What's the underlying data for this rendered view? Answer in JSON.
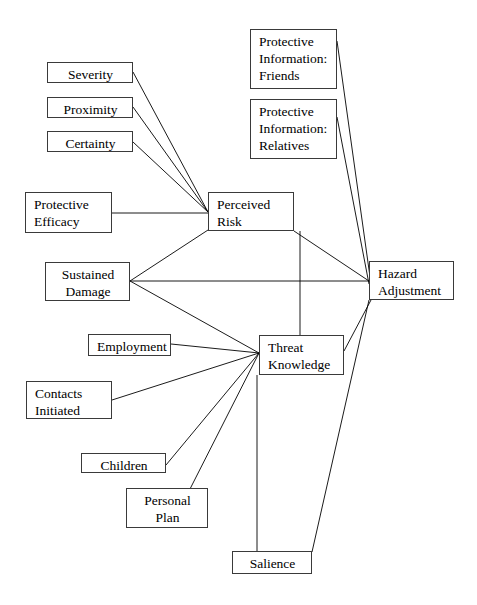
{
  "diagram": {
    "type": "path-diagram",
    "background_color": "#ffffff",
    "box_border_color": "#3a3a3a",
    "edge_color": "#000000",
    "nodes": [
      {
        "id": "severity",
        "label": "Severity",
        "x": 47,
        "y": 62,
        "w": 86,
        "h": 21,
        "align": "center"
      },
      {
        "id": "proximity",
        "label": "Proximity",
        "x": 47,
        "y": 97,
        "w": 86,
        "h": 21,
        "align": "center"
      },
      {
        "id": "certainty",
        "label": "Certainty",
        "x": 47,
        "y": 131,
        "w": 86,
        "h": 21,
        "align": "center"
      },
      {
        "id": "protective-efficacy",
        "label": "Protective\nEfficacy",
        "x": 25,
        "y": 192,
        "w": 87,
        "h": 41,
        "align": "left"
      },
      {
        "id": "sustained-damage",
        "label": "Sustained\nDamage",
        "x": 45,
        "y": 262,
        "w": 85,
        "h": 39,
        "align": "center"
      },
      {
        "id": "employment",
        "label": "Employment",
        "x": 88,
        "y": 334,
        "w": 83,
        "h": 22,
        "align": "center"
      },
      {
        "id": "contacts-initiated",
        "label": "Contacts\nInitiated",
        "x": 26,
        "y": 381,
        "w": 86,
        "h": 38,
        "align": "left"
      },
      {
        "id": "children",
        "label": "Children",
        "x": 81,
        "y": 453,
        "w": 85,
        "h": 20,
        "align": "center"
      },
      {
        "id": "personal-plan",
        "label": "Personal\nPlan",
        "x": 126,
        "y": 488,
        "w": 82,
        "h": 40,
        "align": "center"
      },
      {
        "id": "salience",
        "label": "Salience",
        "x": 232,
        "y": 551,
        "w": 80,
        "h": 23,
        "align": "center"
      },
      {
        "id": "perceived-risk",
        "label": "Perceived\nRisk",
        "x": 208,
        "y": 192,
        "w": 86,
        "h": 39,
        "align": "left"
      },
      {
        "id": "threat-knowledge",
        "label": "Threat\nKnowledge",
        "x": 259,
        "y": 335,
        "w": 85,
        "h": 40,
        "align": "left"
      },
      {
        "id": "protective-info-friends",
        "label": "Protective\nInformation:\nFriends",
        "x": 250,
        "y": 29,
        "w": 87,
        "h": 60,
        "align": "left"
      },
      {
        "id": "protective-info-relatives",
        "label": "Protective\nInformation:\nRelatives",
        "x": 250,
        "y": 99,
        "w": 87,
        "h": 60,
        "align": "left"
      },
      {
        "id": "hazard-adjustment",
        "label": "Hazard\nAdjustment",
        "x": 369,
        "y": 261,
        "w": 85,
        "h": 39,
        "align": "left"
      }
    ],
    "edges": [
      {
        "id": "severity-to-perceived-risk",
        "from": "severity",
        "to": "perceived-risk",
        "x1": 133,
        "y1": 72,
        "x2": 208,
        "y2": 212
      },
      {
        "id": "proximity-to-perceived-risk",
        "from": "proximity",
        "to": "perceived-risk",
        "x1": 133,
        "y1": 107,
        "x2": 208,
        "y2": 212
      },
      {
        "id": "certainty-to-perceived-risk",
        "from": "certainty",
        "to": "perceived-risk",
        "x1": 133,
        "y1": 142,
        "x2": 208,
        "y2": 212
      },
      {
        "id": "protective-efficacy-to-perceived-risk",
        "from": "protective-efficacy",
        "to": "perceived-risk",
        "x1": 112,
        "y1": 213,
        "x2": 208,
        "y2": 213
      },
      {
        "id": "sustained-damage-to-perceived-risk",
        "from": "sustained-damage",
        "to": "perceived-risk",
        "x1": 130,
        "y1": 281,
        "x2": 208,
        "y2": 230
      },
      {
        "id": "sustained-damage-to-hazard-adjustment",
        "from": "sustained-damage",
        "to": "hazard-adjustment",
        "x1": 130,
        "y1": 281,
        "x2": 369,
        "y2": 281
      },
      {
        "id": "sustained-damage-to-threat-knowledge",
        "from": "sustained-damage",
        "to": "threat-knowledge",
        "x1": 130,
        "y1": 281,
        "x2": 259,
        "y2": 353
      },
      {
        "id": "perceived-risk-to-hazard-adjustment",
        "from": "perceived-risk",
        "to": "hazard-adjustment",
        "x1": 294,
        "y1": 231,
        "x2": 369,
        "y2": 281
      },
      {
        "id": "perceived-risk-to-threat-knowledge",
        "from": "perceived-risk",
        "to": "threat-knowledge",
        "x1": 300,
        "y1": 231,
        "x2": 300,
        "y2": 335
      },
      {
        "id": "protective-info-friends-to-hazard-adjustment",
        "from": "protective-info-friends",
        "to": "hazard-adjustment",
        "x1": 337,
        "y1": 41,
        "x2": 371,
        "y2": 284
      },
      {
        "id": "protective-info-relatives-to-hazard-adjustment",
        "from": "protective-info-relatives",
        "to": "hazard-adjustment",
        "x1": 337,
        "y1": 117,
        "x2": 369,
        "y2": 284
      },
      {
        "id": "employment-to-threat-knowledge",
        "from": "employment",
        "to": "threat-knowledge",
        "x1": 171,
        "y1": 344,
        "x2": 259,
        "y2": 353
      },
      {
        "id": "contacts-initiated-to-threat-knowledge",
        "from": "contacts-initiated",
        "to": "threat-knowledge",
        "x1": 112,
        "y1": 400,
        "x2": 259,
        "y2": 353
      },
      {
        "id": "children-to-threat-knowledge",
        "from": "children",
        "to": "threat-knowledge",
        "x1": 166,
        "y1": 465,
        "x2": 259,
        "y2": 353
      },
      {
        "id": "personal-plan-to-threat-knowledge",
        "from": "personal-plan",
        "to": "threat-knowledge",
        "x1": 190,
        "y1": 489,
        "x2": 259,
        "y2": 353
      },
      {
        "id": "threat-knowledge-to-salience",
        "from": "threat-knowledge",
        "to": "salience",
        "x1": 257,
        "y1": 375,
        "x2": 257,
        "y2": 551
      },
      {
        "id": "threat-knowledge-to-hazard-adjustment",
        "from": "threat-knowledge",
        "to": "hazard-adjustment",
        "x1": 344,
        "y1": 351,
        "x2": 371,
        "y2": 300
      },
      {
        "id": "salience-to-hazard-adjustment",
        "from": "salience",
        "to": "hazard-adjustment",
        "x1": 312,
        "y1": 552,
        "x2": 369,
        "y2": 300
      }
    ]
  }
}
